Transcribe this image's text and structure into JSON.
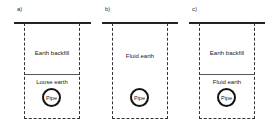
{
  "panels": [
    {
      "label": "a)",
      "upper_layer": "Earth backfill",
      "lower_layer": "Loose earth",
      "pipe": "Pipe"
    },
    {
      "label": "b)",
      "fill_layer": "Fluid earth",
      "pipe": "Pipe"
    },
    {
      "label": "c)",
      "upper_layer": "Earth backfill",
      "lower_layer": "Fluid earth",
      "pipe": "Pipe"
    }
  ],
  "colors": {
    "line": "#222222",
    "background": "#ffffff"
  }
}
